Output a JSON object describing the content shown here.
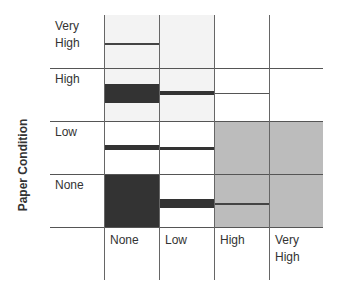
{
  "diagram": {
    "y_axis_title": "Paper Condition",
    "rows": [
      {
        "label_line1": "Very",
        "label_line2": "High"
      },
      {
        "label_line1": "High"
      },
      {
        "label_line1": "Low"
      },
      {
        "label_line1": "None"
      }
    ],
    "columns": [
      {
        "label_line1": "None"
      },
      {
        "label_line1": "Low"
      },
      {
        "label_line1": "High"
      },
      {
        "label_line1": "Very",
        "label_line2": "High"
      }
    ],
    "colors": {
      "dark_bar": "#333333",
      "gray_region": "#bcbcbc",
      "light_region": "#f3f3f3",
      "grid_line": "#555555"
    },
    "cells_description": [
      {
        "row": "Very High",
        "col": "None",
        "mark": "thin line"
      },
      {
        "row": "High",
        "col": "None",
        "mark": "thick dark bar"
      },
      {
        "row": "High",
        "col": "Low",
        "mark": "medium bar"
      },
      {
        "row": "High",
        "col": "High",
        "mark": "thin line"
      },
      {
        "row": "Low",
        "col": "None",
        "mark": "medium bar"
      },
      {
        "row": "Low",
        "col": "Low",
        "mark": "thin bar"
      },
      {
        "row": "None",
        "col": "None",
        "mark": "full dark block"
      },
      {
        "row": "None",
        "col": "Low",
        "mark": "thick bar"
      },
      {
        "row": "None",
        "col": "High",
        "mark": "thin line"
      }
    ]
  }
}
